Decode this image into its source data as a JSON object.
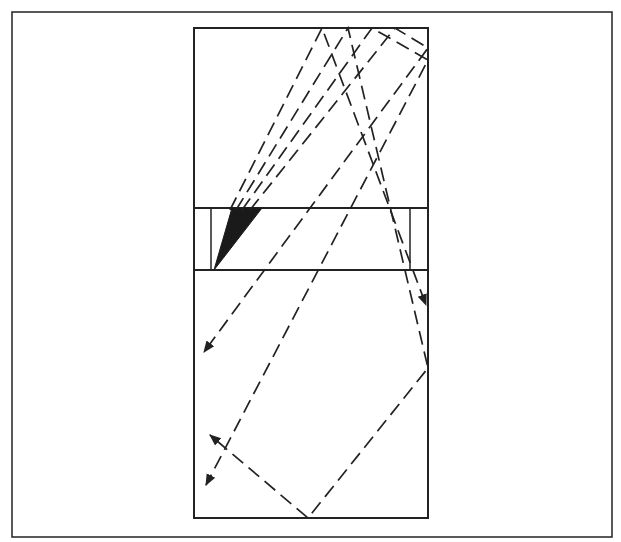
{
  "figure": {
    "type": "optical-ray-diagram",
    "colors": {
      "ink": "#222222",
      "background": "#ffffff",
      "wedge_fill": "#1a1a1a"
    },
    "outer_frame": {
      "x1": 12,
      "y1": 12,
      "x2": 612,
      "y2": 537
    },
    "enclosure": {
      "x1": 194,
      "y1": 28,
      "x2": 428,
      "y2": 518
    },
    "band": {
      "y_top": 208,
      "y_bottom": 270,
      "left_post_x": 211,
      "right_post_x": 410
    },
    "wedge": {
      "points": [
        [
          214,
          270
        ],
        [
          232,
          208
        ],
        [
          262,
          208
        ]
      ]
    },
    "rays": [
      {
        "name": "ray-1",
        "points": [
          [
            230,
            210
          ],
          [
            322,
            28
          ],
          [
            426,
            305
          ]
        ],
        "arrow": true
      },
      {
        "name": "ray-2",
        "points": [
          [
            236,
            210
          ],
          [
            348,
            28
          ],
          [
            428,
            368
          ],
          [
            308,
            518
          ],
          [
            210,
            435
          ]
        ],
        "arrow": true
      },
      {
        "name": "ray-3",
        "points": [
          [
            242,
            210
          ],
          [
            372,
            28
          ],
          [
            428,
            60
          ],
          [
            206,
            485
          ]
        ],
        "arrow": true
      },
      {
        "name": "ray-4",
        "points": [
          [
            250,
            210
          ],
          [
            395,
            28
          ],
          [
            428,
            48
          ],
          [
            204,
            352
          ]
        ],
        "arrow": true
      }
    ]
  }
}
